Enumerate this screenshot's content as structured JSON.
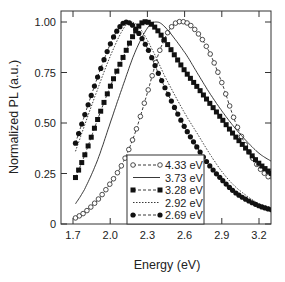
{
  "chart_data": {
    "type": "line",
    "title": "",
    "xlabel": "Energy (eV)",
    "ylabel": "Normalized PL (a.u.)",
    "xlim": [
      1.63,
      3.3
    ],
    "ylim": [
      0,
      1.05
    ],
    "xticks": [
      1.7,
      2.0,
      2.3,
      2.6,
      2.9,
      3.2
    ],
    "xtick_labels": [
      "1.7",
      "2.0",
      "2.3",
      "2.6",
      "2.9",
      "3.2"
    ],
    "yticks": [
      0,
      0.25,
      0.5,
      0.75,
      1.0
    ],
    "ytick_labels": [
      "0",
      "0.25",
      "0.50",
      "0.75",
      "1.00"
    ],
    "grid": false,
    "legend_position": "lower center",
    "series": [
      {
        "name": "4.33 eV",
        "style": "open-circle-dashed",
        "x": [
          1.72,
          1.8,
          1.9,
          2.0,
          2.1,
          2.2,
          2.3,
          2.4,
          2.5,
          2.6,
          2.7,
          2.8,
          2.9,
          3.0,
          3.1,
          3.2,
          3.3
        ],
        "y": [
          0.03,
          0.06,
          0.12,
          0.2,
          0.3,
          0.45,
          0.65,
          0.86,
          0.98,
          1.0,
          0.95,
          0.85,
          0.7,
          0.52,
          0.38,
          0.28,
          0.22
        ]
      },
      {
        "name": "3.73 eV",
        "style": "solid-line",
        "x": [
          1.72,
          1.8,
          1.9,
          2.0,
          2.1,
          2.2,
          2.3,
          2.37,
          2.45,
          2.6,
          2.7,
          2.8,
          2.9,
          3.0,
          3.1,
          3.2,
          3.3
        ],
        "y": [
          0.1,
          0.18,
          0.32,
          0.5,
          0.68,
          0.85,
          0.97,
          1.0,
          0.97,
          0.85,
          0.75,
          0.65,
          0.56,
          0.48,
          0.41,
          0.35,
          0.31
        ]
      },
      {
        "name": "3.28 eV",
        "style": "filled-square-dashed",
        "x": [
          1.72,
          1.8,
          1.9,
          2.0,
          2.1,
          2.2,
          2.27,
          2.35,
          2.45,
          2.6,
          2.7,
          2.8,
          2.9,
          3.0,
          3.1,
          3.2,
          3.3
        ],
        "y": [
          0.23,
          0.35,
          0.52,
          0.68,
          0.82,
          0.95,
          1.0,
          0.98,
          0.9,
          0.76,
          0.68,
          0.6,
          0.52,
          0.44,
          0.37,
          0.3,
          0.25
        ]
      },
      {
        "name": "2.92 eV",
        "style": "dotted-line",
        "x": [
          1.72,
          1.8,
          1.9,
          2.0,
          2.1,
          2.17,
          2.25,
          2.35,
          2.45,
          2.6,
          2.7,
          2.8,
          2.9,
          3.0,
          3.1,
          3.2,
          3.3
        ],
        "y": [
          0.36,
          0.5,
          0.67,
          0.83,
          0.96,
          1.0,
          0.96,
          0.85,
          0.72,
          0.55,
          0.45,
          0.35,
          0.26,
          0.19,
          0.14,
          0.1,
          0.08
        ]
      },
      {
        "name": "2.69 eV",
        "style": "filled-circle-dashed",
        "x": [
          1.72,
          1.8,
          1.9,
          2.0,
          2.07,
          2.13,
          2.2,
          2.3,
          2.4,
          2.5,
          2.6,
          2.7,
          2.8,
          2.9,
          3.0,
          3.1,
          3.2,
          3.3
        ],
        "y": [
          0.4,
          0.55,
          0.73,
          0.89,
          0.97,
          1.0,
          0.97,
          0.87,
          0.73,
          0.6,
          0.48,
          0.38,
          0.29,
          0.22,
          0.16,
          0.12,
          0.09,
          0.07
        ]
      }
    ]
  }
}
